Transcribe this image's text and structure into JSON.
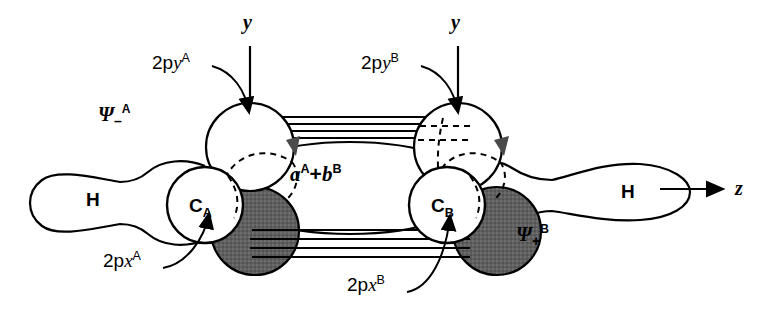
{
  "figure": {
    "background_color": "#ffffff",
    "stroke_color": "#000000",
    "shaded_lobe_color": "#595959",
    "white_lobe_color": "#ffffff"
  },
  "axes": [
    {
      "name": "y-axis-left",
      "label": "y",
      "orientation": "vertical",
      "x": 247,
      "y": 18
    },
    {
      "name": "y-axis-right",
      "label": "y",
      "orientation": "vertical",
      "x": 455,
      "y": 18
    },
    {
      "name": "z-axis",
      "label": "z",
      "orientation": "horizontal",
      "x": 739,
      "y": 185
    }
  ],
  "atoms": [
    {
      "name": "carbon-a",
      "label": "C",
      "subscript": "A",
      "x": 205,
      "y": 205
    },
    {
      "name": "carbon-b",
      "label": "C",
      "subscript": "B",
      "x": 447,
      "y": 205
    },
    {
      "name": "hydrogen-left",
      "label": "H",
      "x": 93,
      "y": 190
    },
    {
      "name": "hydrogen-right",
      "label": "H",
      "x": 628,
      "y": 186
    }
  ],
  "orbital_labels": [
    {
      "name": "2py-a",
      "base": "2p",
      "var": "y",
      "sup": "A",
      "x": 163,
      "y": 62,
      "arrow_to": {
        "x": 249,
        "y": 118
      }
    },
    {
      "name": "2py-b",
      "base": "2p",
      "var": "y",
      "sup": "B",
      "x": 372,
      "y": 62,
      "arrow_to": {
        "x": 458,
        "y": 118
      }
    },
    {
      "name": "2px-a",
      "base": "2p",
      "var": "x",
      "sup": "A",
      "x": 114,
      "y": 259,
      "arrow_to": {
        "x": 210,
        "y": 208
      }
    },
    {
      "name": "2px-b",
      "base": "2p",
      "var": "x",
      "sup": "B",
      "x": 358,
      "y": 283,
      "arrow_to": {
        "x": 452,
        "y": 210
      }
    }
  ],
  "wavefunctions": [
    {
      "name": "psi-minus-a",
      "symbol": "Ψ",
      "sub": "–",
      "sup": "A",
      "x": 104,
      "y": 112
    },
    {
      "name": "psi-plus-b",
      "symbol": "Ψ",
      "sub": "+",
      "sup": "B",
      "x": 522,
      "y": 232
    }
  ],
  "combination_label": {
    "name": "orbital-combination",
    "left": "a",
    "left_sup": "A",
    "operator": "+",
    "right": "b",
    "right_sup": "B",
    "x": 295,
    "y": 172
  },
  "bond_lines": {
    "name": "pi-overlap-lines",
    "upper_count": 4,
    "lower_count": 4,
    "upper_y": [
      118,
      124,
      130,
      136
    ],
    "lower_y": [
      231,
      239,
      247,
      255
    ],
    "x_start": 248,
    "x_end": 458
  },
  "lobes": {
    "upper_white_spheres": [
      {
        "name": "2py-a-upper-lobe",
        "cx": 250,
        "cy": 147,
        "r": 44
      },
      {
        "name": "2py-b-upper-lobe",
        "cx": 458,
        "cy": 147,
        "r": 44
      }
    ],
    "lower_shaded_spheres": [
      {
        "name": "2px-a-lower-lobe",
        "cx": 255,
        "cy": 231,
        "r": 44
      },
      {
        "name": "2px-b-lower-lobe",
        "cx": 497,
        "cy": 231,
        "r": 44
      }
    ],
    "carbon_circles": [
      {
        "name": "carbon-a-circle",
        "cx": 205,
        "cy": 205,
        "r": 38
      },
      {
        "name": "carbon-b-circle",
        "cx": 447,
        "cy": 205,
        "r": 38
      }
    ],
    "sigma_lobes": [
      {
        "name": "hydrogen-left-lobe",
        "cx": 93,
        "cy": 190
      },
      {
        "name": "hydrogen-right-lobe",
        "cx": 628,
        "cy": 186
      }
    ],
    "central_ellipse": {
      "name": "central-bonding-lobe",
      "cx": 350,
      "cy": 188,
      "rx": 128,
      "ry": 46
    }
  }
}
